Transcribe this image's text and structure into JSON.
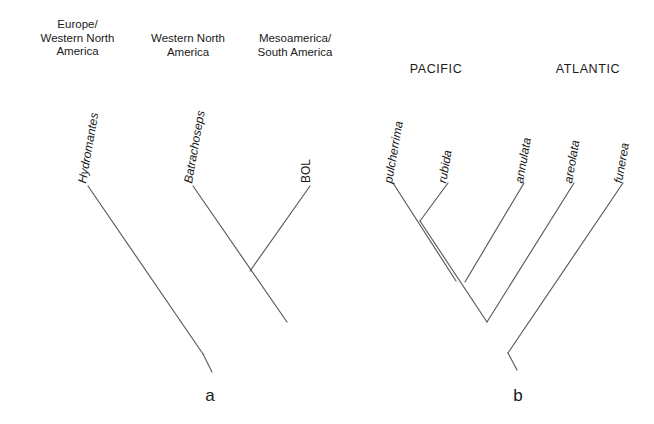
{
  "figure": {
    "background_color": "#ffffff",
    "line_color": "#5a5a5a",
    "text_color": "#1a1a1a"
  },
  "panels": [
    {
      "letter": "a",
      "letter_x": 210,
      "letter_y": 386,
      "region_headers": [
        {
          "text": "Europe/\nWestern North\nAmerica",
          "x": 15,
          "y": 18,
          "width": 125
        },
        {
          "text": "Western North\nAmerica",
          "x": 133,
          "y": 32,
          "width": 110
        },
        {
          "text": "Mesoamerica/\nSouth America",
          "x": 239,
          "y": 32,
          "width": 112
        }
      ],
      "taxa": [
        {
          "label": "Hydromantes",
          "italic": true,
          "x": 82,
          "y": 176,
          "angle": -80
        },
        {
          "label": "Batrachoseps",
          "italic": true,
          "x": 188,
          "y": 176,
          "angle": -80
        },
        {
          "label": "BOL",
          "italic": false,
          "x": 306,
          "y": 176,
          "angle": -90
        }
      ],
      "branches": [
        {
          "name": "branch-hydromantes",
          "x1": 88,
          "y1": 186,
          "x2": 203,
          "y2": 354
        },
        {
          "name": "branch-batrachoseps",
          "x1": 193,
          "y1": 186,
          "x2": 287,
          "y2": 322
        },
        {
          "name": "branch-bol",
          "x1": 310,
          "y1": 186,
          "x2": 250,
          "y2": 271
        },
        {
          "name": "branch-root-stem",
          "x1": 203,
          "y1": 354,
          "x2": 212,
          "y2": 372
        }
      ]
    },
    {
      "letter": "b",
      "letter_x": 518,
      "letter_y": 386,
      "ocean_headers": [
        {
          "text": "PACIFIC",
          "x": 400,
          "y": 62,
          "width": 72
        },
        {
          "text": "ATLANTIC",
          "x": 548,
          "y": 62,
          "width": 80
        }
      ],
      "taxa": [
        {
          "label": "pulcherrima",
          "italic": true,
          "x": 388,
          "y": 176,
          "angle": -80
        },
        {
          "label": "rubida",
          "italic": true,
          "x": 442,
          "y": 176,
          "angle": -80
        },
        {
          "label": "annulata",
          "italic": true,
          "x": 519,
          "y": 176,
          "angle": -80
        },
        {
          "label": "areolata",
          "italic": true,
          "x": 568,
          "y": 176,
          "angle": -80
        },
        {
          "label": "funerea",
          "italic": true,
          "x": 618,
          "y": 176,
          "angle": -80
        }
      ],
      "branches": [
        {
          "name": "branch-pulcherrima",
          "x1": 393,
          "y1": 183,
          "x2": 456,
          "y2": 281
        },
        {
          "name": "branch-rubida",
          "x1": 448,
          "y1": 183,
          "x2": 420,
          "y2": 221
        },
        {
          "name": "branch-annulata",
          "x1": 524,
          "y1": 183,
          "x2": 465,
          "y2": 282
        },
        {
          "name": "branch-areolata",
          "x1": 574,
          "y1": 183,
          "x2": 487,
          "y2": 322
        },
        {
          "name": "branch-funerea",
          "x1": 623,
          "y1": 183,
          "x2": 508,
          "y2": 353
        },
        {
          "name": "branch-node1-to-node2",
          "x1": 420,
          "y1": 221,
          "x2": 487,
          "y2": 322
        },
        {
          "name": "branch-root-stem",
          "x1": 508,
          "y1": 353,
          "x2": 517,
          "y2": 370
        }
      ]
    }
  ],
  "chart_data": {
    "type": "diagram",
    "diagram_kind": "cladogram",
    "title": "",
    "trees": [
      {
        "panel": "a",
        "tips": [
          "Hydromantes",
          "Batrachoseps",
          "BOL"
        ],
        "tip_annotations": [
          "Europe/Western North America",
          "Western North America",
          "Mesoamerica/South America"
        ],
        "topology": "(Hydromantes,(Batrachoseps,BOL));"
      },
      {
        "panel": "b",
        "tips": [
          "pulcherrima",
          "rubida",
          "annulata",
          "areolata",
          "funerea"
        ],
        "tip_groups": [
          "PACIFIC",
          "PACIFIC",
          "ATLANTIC",
          "ATLANTIC",
          "ATLANTIC"
        ],
        "topology": "((((pulcherrima,rubida),annulata),areolata),funerea);"
      }
    ]
  }
}
